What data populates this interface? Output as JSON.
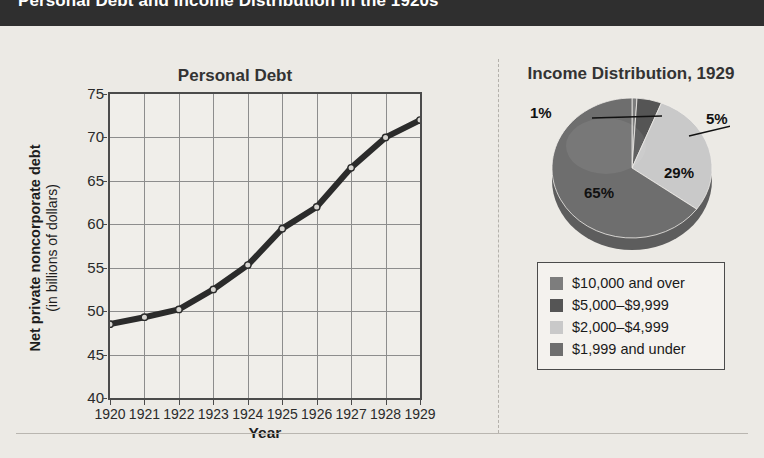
{
  "header": {
    "title": "Personal Debt and Income Distribution in the 1920s"
  },
  "line_panel": {
    "title": "Personal Debt",
    "ylabel_main": "Net private noncorporate debt",
    "ylabel_sub": "(in billions of dollars)",
    "xlabel": "Year"
  },
  "pie_panel": {
    "title": "Income Distribution, 1929"
  },
  "legend": {
    "items": [
      {
        "label": "$10,000 and over",
        "color": "#7d7d7d"
      },
      {
        "label": "$5,000–$9,999",
        "color": "#555555"
      },
      {
        "label": "$2,000–$4,999",
        "color": "#c9c9c9"
      },
      {
        "label": "$1,999 and under",
        "color": "#6e6e6e"
      }
    ]
  },
  "chart_data": [
    {
      "type": "line",
      "title": "Personal Debt",
      "xlabel": "Year",
      "ylabel": "Net private noncorporate debt (in billions of dollars)",
      "x": [
        1920,
        1921,
        1922,
        1923,
        1924,
        1925,
        1926,
        1927,
        1928,
        1929
      ],
      "xtick_labels": [
        "1920",
        "1921",
        "1922",
        "1923",
        "1924",
        "1925",
        "1926",
        "1927",
        "1928",
        "1929"
      ],
      "values": [
        48.5,
        49.3,
        50.2,
        52.5,
        55.3,
        59.5,
        62.0,
        66.5,
        70.0,
        72.0
      ],
      "ylim": [
        40,
        75
      ],
      "ytick_labels": [
        "75",
        "70",
        "65",
        "60",
        "55",
        "50",
        "45",
        "40"
      ],
      "yticks": [
        75,
        70,
        65,
        60,
        55,
        50,
        45,
        40
      ],
      "grid": true,
      "legend_position": "none",
      "series_color": "#2b2b2b",
      "marker": "circle"
    },
    {
      "type": "pie",
      "title": "Income Distribution, 1929",
      "categories": [
        "$10,000 and over",
        "$5,000–$9,999",
        "$2,000–$4,999",
        "$1,999 and under"
      ],
      "values": [
        1,
        5,
        29,
        65
      ],
      "data_labels": [
        "1%",
        "5%",
        "29%",
        "65%"
      ],
      "colors": [
        "#7d7d7d",
        "#555555",
        "#c9c9c9",
        "#6e6e6e"
      ],
      "legend_position": "below"
    }
  ]
}
